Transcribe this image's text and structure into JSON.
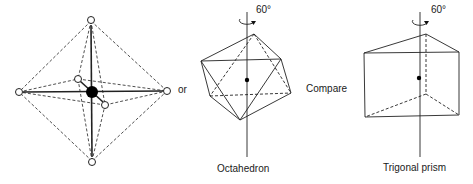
{
  "figure": {
    "connector_label": "or",
    "compare_label": "Compare",
    "octahedron": {
      "caption": "Octahedron",
      "rotation_label": "60°"
    },
    "trigonal_prism": {
      "caption": "Trigonal prism",
      "rotation_label": "60°"
    }
  }
}
